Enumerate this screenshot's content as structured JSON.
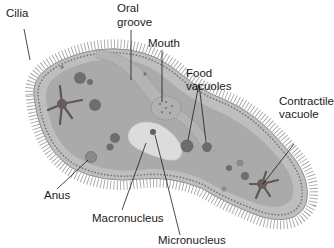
{
  "diagram": {
    "labels": {
      "cilia": "Cilia",
      "oral_groove_line1": "Oral",
      "oral_groove_line2": "groove",
      "mouth": "Mouth",
      "food_vacuoles_line1": "Food",
      "food_vacuoles_line2": "vacuoles",
      "contractile_vacuole_line1": "Contractile",
      "contractile_vacuole_line2": "vacuole",
      "anus": "Anus",
      "macronucleus": "Macronucleus",
      "micronucleus": "Micronucleus"
    },
    "colors": {
      "background": "#ffffff",
      "cell_outer": "#b9bab9",
      "cell_inner": "#a9aaa9",
      "cell_border": "#8e8f8e",
      "pellicle_dots": "#6e6f6e",
      "cilia": "#8a8a8a",
      "vacuole_dark": "#5f605f",
      "contractile_vacuole": "#6a5a5a",
      "macronucleus": "#dcdcdc",
      "leader_line": "#1a1a1a",
      "text": "#1a1a1a"
    }
  }
}
